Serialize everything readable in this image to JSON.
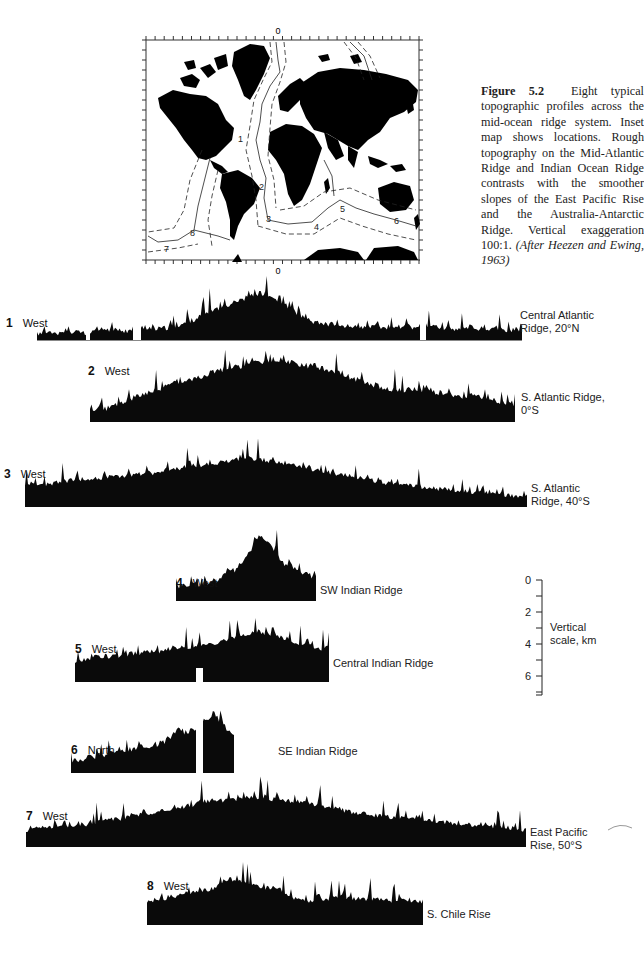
{
  "figure": {
    "number": "Figure 5.2",
    "caption_main": "Eight typical topographic profiles across the mid-ocean ridge system. Inset map shows locations. Rough topography on the Mid-Atlantic Ridge and Indian Ocean Ridge contrasts with the smoother slopes of the East Pacific Rise and the Australia-Antarctic Ridge. Vertical exaggeration 100:1.",
    "caption_source": "(After Heezen and Ewing, 1963)"
  },
  "inset_map": {
    "top_meridian_label": "0",
    "bottom_meridian_label": "0",
    "profile_markers": [
      "1",
      "2",
      "3",
      "4",
      "5",
      "6",
      "7",
      "8"
    ]
  },
  "vertical_scale": {
    "ticks": [
      "0",
      "2",
      "4",
      "6"
    ],
    "label_line1": "Vertical",
    "label_line2": "scale, km"
  },
  "profiles": [
    {
      "num": "1",
      "direction": "West",
      "name_line1": "Central Atlantic",
      "name_line2": "Ridge, 20°N"
    },
    {
      "num": "2",
      "direction": "West",
      "name_line1": "S. Atlantic Ridge,",
      "name_line2": "0°S"
    },
    {
      "num": "3",
      "direction": "West",
      "name_line1": "S. Atlantic",
      "name_line2": "Ridge, 40°S"
    },
    {
      "num": "4",
      "direction": "West",
      "name_line1": "SW Indian Ridge",
      "name_line2": ""
    },
    {
      "num": "5",
      "direction": "West",
      "name_line1": "Central Indian Ridge",
      "name_line2": ""
    },
    {
      "num": "6",
      "direction": "North",
      "name_line1": "SE Indian Ridge",
      "name_line2": ""
    },
    {
      "num": "7",
      "direction": "West",
      "name_line1": "East Pacific",
      "name_line2": "Rise, 50°S"
    },
    {
      "num": "8",
      "direction": "West",
      "name_line1": "S. Chile Rise",
      "name_line2": ""
    }
  ],
  "chart_data": {
    "type": "area",
    "title": "Eight typical topographic profiles across the mid-ocean ridge system",
    "ylabel": "Vertical scale, km",
    "yticks": [
      0,
      2,
      4,
      6
    ],
    "vertical_exaggeration": "100:1",
    "series": [
      {
        "name": "1 Central Atlantic Ridge, 20°N",
        "relief_profile": [
          0.3,
          0.35,
          0.3,
          0.4,
          0.3,
          0.5,
          0.45,
          0.4,
          0.6,
          0.5,
          0.55,
          0.7,
          0.9,
          1.2,
          1.4,
          1.6,
          1.8,
          2.0,
          1.8,
          1.5,
          1.1,
          0.8,
          0.7,
          0.65,
          0.6,
          0.55,
          0.6,
          0.5,
          0.6,
          0.55,
          0.6,
          0.55,
          0.5,
          0.6,
          0.45,
          0.5,
          0.45,
          0.5
        ]
      },
      {
        "name": "2 S. Atlantic Ridge, 0°S",
        "relief_profile": [
          0.4,
          0.5,
          0.7,
          0.9,
          1.1,
          1.3,
          1.5,
          1.6,
          1.8,
          2.0,
          2.1,
          2.2,
          2.3,
          2.4,
          2.3,
          2.2,
          2.1,
          2.0,
          1.8,
          1.6,
          1.4,
          1.3,
          1.2,
          1.3,
          1.2,
          1.1,
          1.0,
          1.0,
          0.9,
          0.8,
          0.7
        ]
      },
      {
        "name": "3 S. Atlantic Ridge, 40°S",
        "relief_profile": [
          1.2,
          1.3,
          1.5,
          1.6,
          1.7,
          1.8,
          1.9,
          2.0,
          2.2,
          2.4,
          2.5,
          2.7,
          2.8,
          2.7,
          2.5,
          2.3,
          2.1,
          1.9,
          1.7,
          1.5,
          1.3,
          1.2,
          1.1,
          1.0,
          0.9,
          0.8,
          0.7,
          0.6
        ]
      },
      {
        "name": "4 SW Indian Ridge",
        "relief_profile": [
          0.7,
          0.7,
          0.8,
          0.8,
          0.9,
          1.0,
          1.3,
          1.5,
          1.9,
          2.8,
          3.0,
          2.4,
          1.8,
          1.6,
          1.4,
          1.2,
          1.0
        ]
      },
      {
        "name": "5 Central Indian Ridge",
        "relief_profile": [
          1.0,
          1.1,
          1.2,
          1.2,
          1.3,
          1.4,
          1.4,
          1.6,
          1.6,
          1.7,
          1.8,
          2.0,
          2.2,
          2.3,
          2.2,
          2.0,
          1.8,
          1.6,
          1.5
        ]
      },
      {
        "name": "6 SE Indian Ridge",
        "relief_profile": [
          0.6,
          0.7,
          0.8,
          0.9,
          1.0,
          1.1,
          1.2,
          1.3,
          1.4,
          1.5,
          1.9,
          2.0,
          2.2,
          2.6,
          3.0,
          2.4,
          1.8
        ]
      },
      {
        "name": "7 East Pacific Rise, 50°S",
        "relief_profile": [
          0.8,
          0.9,
          1.0,
          1.1,
          1.3,
          1.5,
          1.7,
          1.9,
          2.1,
          2.2,
          2.3,
          2.2,
          2.1,
          1.9,
          1.7,
          1.5,
          1.4,
          1.3,
          1.2,
          1.1,
          1.0,
          0.9,
          0.8
        ]
      },
      {
        "name": "8 S. Chile Rise",
        "relief_profile": [
          1.2,
          1.3,
          1.5,
          1.6,
          1.8,
          2.3,
          2.2,
          1.8,
          1.9,
          1.3,
          1.2,
          1.3,
          1.4,
          1.3,
          1.3,
          1.2,
          1.2,
          1.1
        ]
      }
    ]
  }
}
